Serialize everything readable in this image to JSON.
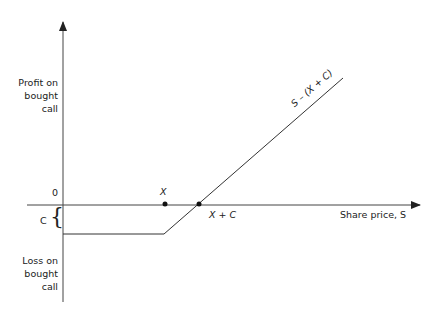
{
  "diagram": {
    "y_axis": {
      "upper_label": [
        "Profit on",
        "bought",
        "call"
      ],
      "lower_label": [
        "Loss on",
        "bought",
        "call"
      ],
      "zero_label": "0",
      "premium_label": "C",
      "premium_brace": "{"
    },
    "x_axis": {
      "label": "Share price, S"
    },
    "points": {
      "strike_label": "X",
      "breakeven_label": "X + C"
    },
    "payoff_line_label": "S – (X + C)",
    "colors": {
      "line": "#333333",
      "text": "#222222"
    }
  }
}
